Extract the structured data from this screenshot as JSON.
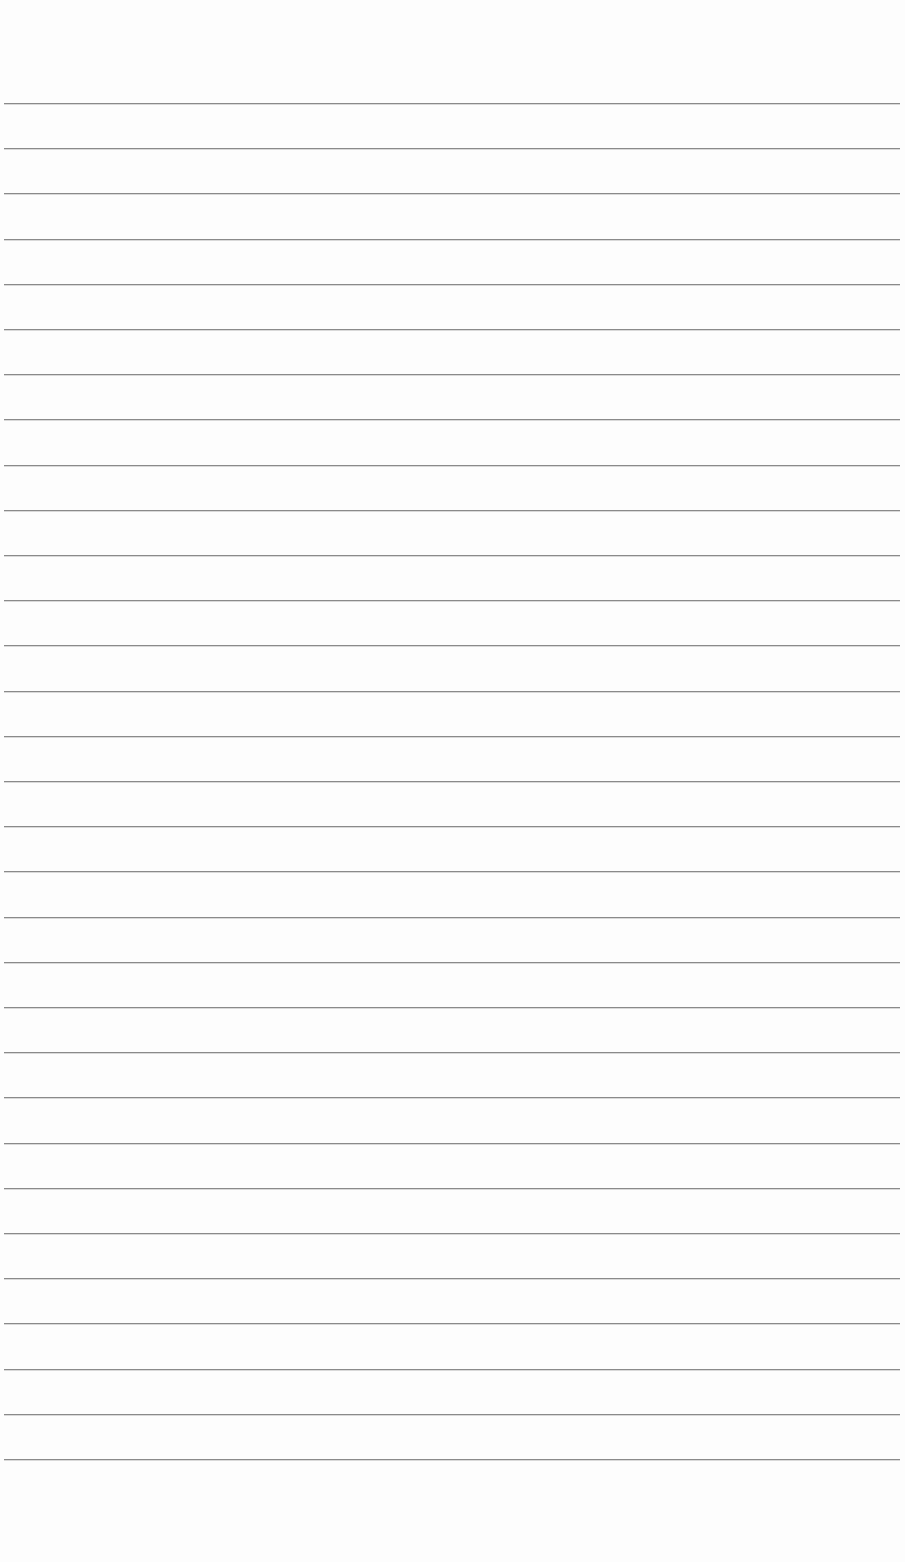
{
  "page": {
    "type": "lined-paper",
    "width": 905,
    "height": 1562,
    "background_color": "#fdfdfd",
    "line_color": "#8a8a8a",
    "line_count": 31,
    "first_line_y": 103,
    "line_spacing": 45.2,
    "line_left": 4,
    "line_right": 900,
    "text_content": []
  }
}
